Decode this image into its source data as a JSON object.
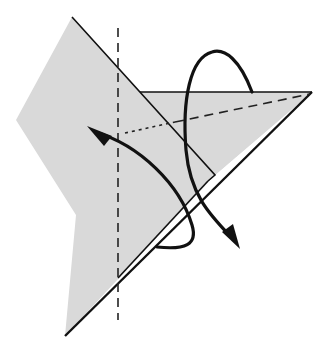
{
  "diagram": {
    "type": "origami-fold-step",
    "colors": {
      "paper": "#d9d9d9",
      "lines": "#111111",
      "background": "#ffffff"
    },
    "elements": [
      {
        "name": "paper-back-layer",
        "kind": "polygon"
      },
      {
        "name": "paper-front-flap",
        "kind": "polygon"
      },
      {
        "name": "vertical-valley-fold-line",
        "kind": "dashed-line"
      },
      {
        "name": "diagonal-fold-line",
        "kind": "dashed-line"
      },
      {
        "name": "hidden-edge-line",
        "kind": "dotted-line"
      },
      {
        "name": "fold-arrow-left",
        "kind": "curved-arrow"
      },
      {
        "name": "fold-arrow-loop",
        "kind": "curved-arrow"
      }
    ]
  }
}
